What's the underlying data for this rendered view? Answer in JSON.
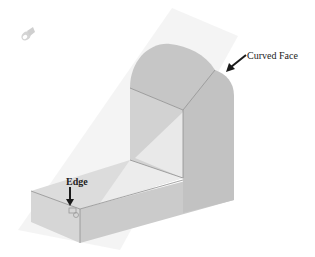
{
  "figure": {
    "colors": {
      "background": "#ffffff",
      "plane": "#f1f1f1",
      "face_dark": "#bdbdbd",
      "face_mid": "#c8c8c8",
      "face_light": "#e4e4e4",
      "face_highlight": "#efefef",
      "edge_line": "#8a8a8a",
      "arrow": "#1a1a1a",
      "icon": "#d0d0d0"
    }
  },
  "labels": {
    "curved_face": "Curved Face",
    "edge": "Edge"
  },
  "icons": {
    "cursor_icon": "selection-cursor-icon",
    "edge_cursor": "edge-select-cursor-icon"
  }
}
